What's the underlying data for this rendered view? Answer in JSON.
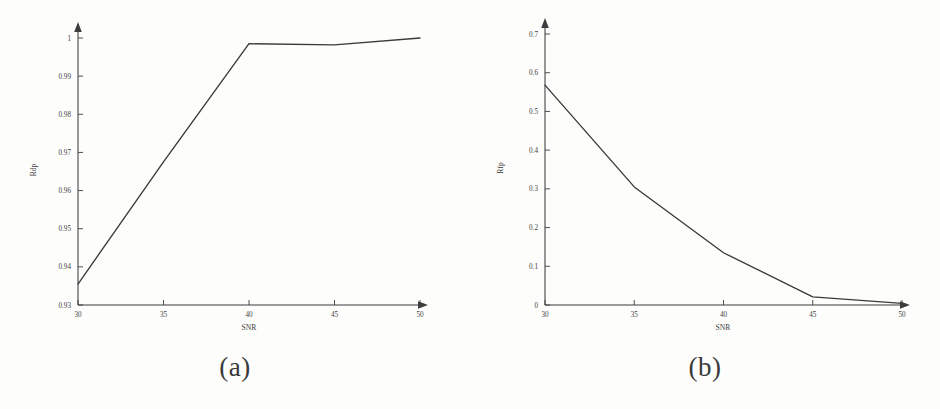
{
  "figure": {
    "background_color": "#fdfdfc",
    "ink_color": "#3d3d3d",
    "panels": [
      {
        "caption": "(a)"
      },
      {
        "caption": "(b)"
      }
    ]
  },
  "chart_data": [
    {
      "type": "line",
      "panel": "(a)",
      "title": "",
      "xlabel": "SNR",
      "ylabel": "Rdp",
      "x": [
        30,
        35,
        40,
        45,
        50
      ],
      "xticklabels": [
        "30",
        "35",
        "40",
        "45",
        "50"
      ],
      "values": [
        0.9355,
        0.9675,
        0.9985,
        0.9982,
        1.0
      ],
      "yticks": [
        0.93,
        0.94,
        0.95,
        0.96,
        0.97,
        0.98,
        0.99,
        1.0
      ],
      "yticklabels": [
        "0.93",
        "0.94",
        "0.95",
        "0.96",
        "0.97",
        "0.98",
        "0.99",
        "1"
      ],
      "xlim": [
        30,
        50
      ],
      "ylim": [
        0.93,
        1.0
      ],
      "grid": false,
      "legend": false,
      "line_color": "#3a3a3a"
    },
    {
      "type": "line",
      "panel": "(b)",
      "title": "",
      "xlabel": "SNR",
      "ylabel": "Rfp",
      "x": [
        30,
        35,
        40,
        45,
        50
      ],
      "xticklabels": [
        "30",
        "35",
        "40",
        "45",
        "50"
      ],
      "values": [
        0.568,
        0.305,
        0.135,
        0.021,
        0.004
      ],
      "yticks": [
        0,
        0.1,
        0.2,
        0.3,
        0.4,
        0.5,
        0.6,
        0.7
      ],
      "yticklabels": [
        "0",
        "0.1",
        "0.2",
        "0.3",
        "0.4",
        "0.5",
        "0.6",
        "0.7"
      ],
      "xlim": [
        30,
        50
      ],
      "ylim": [
        0,
        0.7
      ],
      "grid": false,
      "legend": false,
      "line_color": "#3a3a3a"
    }
  ]
}
